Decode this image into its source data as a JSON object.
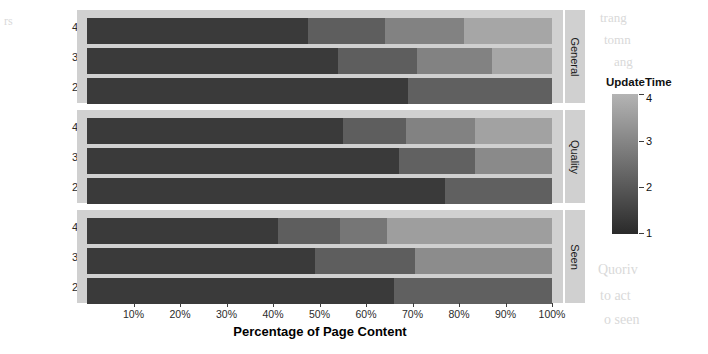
{
  "chart_data": {
    "type": "bar",
    "orientation": "horizontal",
    "stacked": true,
    "stack_mode": "percent",
    "title": "",
    "xlabel": "Percentage of Page Content",
    "ylabel": "Number of Timestamps",
    "xlim": [
      0,
      100
    ],
    "xtick_labels": [
      "10%",
      "20%",
      "30%",
      "40%",
      "50%",
      "60%",
      "70%",
      "80%",
      "90%",
      "100%"
    ],
    "xtick_values": [
      10,
      20,
      30,
      40,
      50,
      60,
      70,
      80,
      90,
      100
    ],
    "grid": false,
    "legend": {
      "title": "UpdateTime",
      "type": "continuous-colorbar",
      "position": "right",
      "tick_labels": [
        "4",
        "3",
        "2",
        "1"
      ],
      "tick_values": [
        4,
        3,
        2,
        1
      ],
      "low_color": "#2a2a2a",
      "high_color": "#b4b4b4"
    },
    "facets": [
      {
        "label": "General",
        "categories": [
          "4",
          "3",
          "2"
        ],
        "rows": [
          {
            "category": "4",
            "segments": [
              {
                "update_time": 1,
                "value": 47.5,
                "color": "#3a3a3a"
              },
              {
                "update_time": 2,
                "value": 16.5,
                "color": "#5e5e5e"
              },
              {
                "update_time": 3,
                "value": 17.0,
                "color": "#828282"
              },
              {
                "update_time": 4,
                "value": 19.0,
                "color": "#a6a6a6"
              }
            ]
          },
          {
            "category": "3",
            "segments": [
              {
                "update_time": 1,
                "value": 54.0,
                "color": "#3a3a3a"
              },
              {
                "update_time": 2,
                "value": 17.0,
                "color": "#5e5e5e"
              },
              {
                "update_time": 3,
                "value": 16.0,
                "color": "#828282"
              },
              {
                "update_time": 4,
                "value": 13.0,
                "color": "#a6a6a6"
              }
            ]
          },
          {
            "category": "2",
            "segments": [
              {
                "update_time": 1,
                "value": 69.0,
                "color": "#3a3a3a"
              },
              {
                "update_time": 2,
                "value": 31.0,
                "color": "#606060"
              }
            ]
          }
        ]
      },
      {
        "label": "Quality",
        "categories": [
          "4",
          "3",
          "2"
        ],
        "rows": [
          {
            "category": "4",
            "segments": [
              {
                "update_time": 1,
                "value": 55.0,
                "color": "#3a3a3a"
              },
              {
                "update_time": 2,
                "value": 13.5,
                "color": "#5e5e5e"
              },
              {
                "update_time": 3,
                "value": 15.0,
                "color": "#828282"
              },
              {
                "update_time": 4,
                "value": 16.5,
                "color": "#a2a2a2"
              }
            ]
          },
          {
            "category": "3",
            "segments": [
              {
                "update_time": 1,
                "value": 67.0,
                "color": "#3a3a3a"
              },
              {
                "update_time": 2,
                "value": 16.5,
                "color": "#616161"
              },
              {
                "update_time": 3,
                "value": 16.5,
                "color": "#8a8a8a"
              }
            ]
          },
          {
            "category": "2",
            "segments": [
              {
                "update_time": 1,
                "value": 77.0,
                "color": "#3a3a3a"
              },
              {
                "update_time": 2,
                "value": 23.0,
                "color": "#606060"
              }
            ]
          }
        ]
      },
      {
        "label": "Seen",
        "categories": [
          "4",
          "3",
          "2"
        ],
        "rows": [
          {
            "category": "4",
            "segments": [
              {
                "update_time": 1,
                "value": 41.0,
                "color": "#3a3a3a"
              },
              {
                "update_time": 2,
                "value": 13.5,
                "color": "#5e5e5e"
              },
              {
                "update_time": 3,
                "value": 10.0,
                "color": "#767676"
              },
              {
                "update_time": 4,
                "value": 35.5,
                "color": "#9e9e9e"
              }
            ]
          },
          {
            "category": "3",
            "segments": [
              {
                "update_time": 1,
                "value": 49.0,
                "color": "#3a3a3a"
              },
              {
                "update_time": 2,
                "value": 21.5,
                "color": "#5e5e5e"
              },
              {
                "update_time": 3,
                "value": 29.5,
                "color": "#8c8c8c"
              }
            ]
          },
          {
            "category": "2",
            "segments": [
              {
                "update_time": 1,
                "value": 66.0,
                "color": "#3a3a3a"
              },
              {
                "update_time": 2,
                "value": 34.0,
                "color": "#606060"
              }
            ]
          }
        ]
      }
    ]
  },
  "ghost_text": {
    "left_top": "rs",
    "left_mid": "",
    "right_top_1": "trang",
    "right_top_2": "tomn",
    "right_mid": "ang",
    "right_low_1": "Quoriv",
    "right_low_2": "to act",
    "right_low_3": "o seen"
  }
}
